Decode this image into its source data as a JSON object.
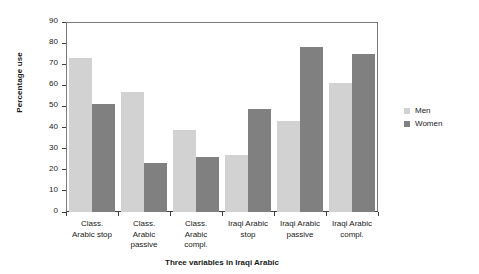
{
  "chart_data": {
    "type": "bar",
    "title": "",
    "xlabel": "Three variables in Iraqi Arabic",
    "ylabel": "Percentage use",
    "ylim": [
      0,
      90
    ],
    "ytick_step": 10,
    "grid": false,
    "legend_position": "right",
    "categories": [
      "Class.\nArabic stop",
      "Class.\nArabic\npassive",
      "Class.\nArabic\ncompl.",
      "Iraqi Arabic\nstop",
      "Iraqi Arabic\npassive",
      "Iraqi Arabic\ncompl."
    ],
    "yticks": [
      "0",
      "10",
      "20",
      "30",
      "40",
      "50",
      "60",
      "70",
      "80",
      "90"
    ],
    "series": [
      {
        "name": "Men",
        "color": "#d2d2d2",
        "values": [
          73,
          57,
          39,
          27,
          43,
          61
        ]
      },
      {
        "name": "Women",
        "color": "#808080",
        "values": [
          51,
          23,
          26,
          49,
          78,
          75
        ]
      }
    ]
  }
}
